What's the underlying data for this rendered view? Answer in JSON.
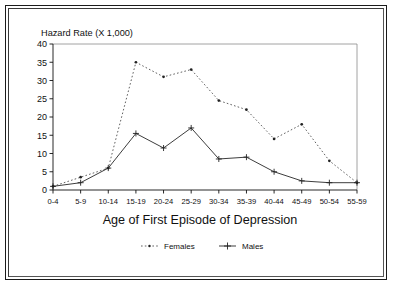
{
  "figure": {
    "border_color": "#1b1b1b",
    "background": "#ffffff"
  },
  "chart_data": {
    "type": "line",
    "title": "",
    "ylabel": "Hazard Rate (X 1,000)",
    "xlabel": "Age of First Episode of Depression",
    "categories": [
      "0-4",
      "5-9",
      "10-14",
      "15-19",
      "20-24",
      "25-29",
      "30-34",
      "35-39",
      "40-44",
      "45-49",
      "50-54",
      "55-59"
    ],
    "ylim": [
      0,
      40
    ],
    "yticks": [
      0,
      5,
      10,
      15,
      20,
      25,
      30,
      35,
      40
    ],
    "grid": false,
    "legend_position": "below-axes",
    "series": [
      {
        "name": "Females",
        "line_style": "dotted",
        "marker": "dot",
        "color": "#444444",
        "values": [
          1,
          3.5,
          6,
          35,
          31,
          33,
          24.5,
          22,
          14,
          18,
          8,
          2
        ]
      },
      {
        "name": "Males",
        "line_style": "solid",
        "marker": "plus",
        "color": "#333333",
        "values": [
          1,
          2,
          6,
          15.5,
          11.5,
          17,
          8.5,
          9,
          5,
          2.5,
          2,
          2
        ]
      }
    ]
  },
  "legend": {
    "items": [
      {
        "label": "Females"
      },
      {
        "label": "Males"
      }
    ]
  }
}
